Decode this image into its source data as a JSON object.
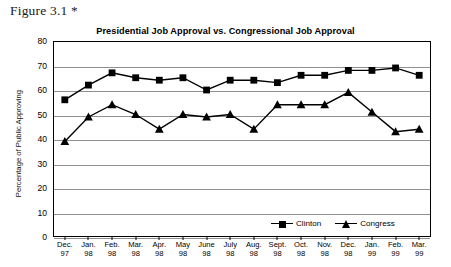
{
  "figure": {
    "caption": "Figure 3.1 *"
  },
  "chart_data": {
    "type": "line",
    "title": "Presidential Job Approval vs. Congressional Job Approval",
    "xlabel": "",
    "ylabel": "Percentage of Public Approving",
    "ylim": [
      0,
      80
    ],
    "ytick_step": 10,
    "yticks": [
      0,
      10,
      20,
      30,
      40,
      50,
      60,
      70,
      80
    ],
    "grid": true,
    "legend_position": "bottom-right",
    "categories": [
      "Dec. 97",
      "Jan. 98",
      "Feb. 98",
      "Mar. 98",
      "Apr. 98",
      "May 98",
      "June 98",
      "July 98",
      "Aug. 98",
      "Sept. 98",
      "Oct. 98",
      "Nov. 98",
      "Dec. 98",
      "Jan. 99",
      "Feb. 99",
      "Mar. 99"
    ],
    "categories_month": [
      "Dec.",
      "Jan.",
      "Feb.",
      "Mar.",
      "Apr.",
      "May",
      "June",
      "July",
      "Aug.",
      "Sept.",
      "Oct.",
      "Nov.",
      "Dec.",
      "Jan.",
      "Feb.",
      "Mar."
    ],
    "categories_year": [
      "97",
      "98",
      "98",
      "98",
      "98",
      "98",
      "98",
      "98",
      "98",
      "98",
      "98",
      "98",
      "98",
      "99",
      "99",
      "99"
    ],
    "series": [
      {
        "name": "Clinton",
        "marker": "square",
        "color": "#000000",
        "values": [
          56,
          62,
          67,
          65,
          64,
          65,
          60,
          64,
          64,
          63,
          66,
          66,
          68,
          68,
          69,
          66
        ]
      },
      {
        "name": "Congress",
        "marker": "triangle",
        "color": "#000000",
        "values": [
          39,
          49,
          54,
          50,
          44,
          50,
          49,
          50,
          44,
          54,
          54,
          54,
          59,
          51,
          43,
          44
        ]
      }
    ]
  }
}
